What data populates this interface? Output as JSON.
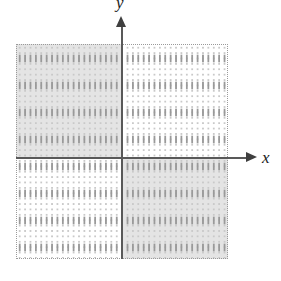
{
  "figure": {
    "kind": "coordinate-plane",
    "width": 281,
    "height": 281,
    "background_color": "#ffffff"
  },
  "axes": {
    "x": {
      "label": "x",
      "color": "#595959",
      "arrow_direction": "right",
      "arrow_color": "#3f3f3f"
    },
    "y": {
      "label": "y",
      "color": "#595959",
      "arrow_direction": "up",
      "arrow_color": "#3f3f3f"
    },
    "origin": {
      "x": 122,
      "y": 158
    }
  },
  "grid": {
    "left": 16,
    "top": 44,
    "right": 228,
    "bottom": 259,
    "minor_spacing": 5.4,
    "major_spacing": 27,
    "minor_dot_color": "#c9c9c9",
    "major_dot_color": "#9a9a9a",
    "border_color": "#9a9a9a"
  },
  "shaded_regions": [
    {
      "name": "quadrant-II",
      "label": "upper-left",
      "fill_color": "#e4e4e4",
      "left": 16,
      "top": 44,
      "width": 106,
      "height": 114
    },
    {
      "name": "quadrant-IV",
      "label": "lower-right",
      "fill_color": "#e4e4e4",
      "left": 122,
      "top": 158,
      "width": 106,
      "height": 101
    }
  ],
  "chart_data": {
    "type": "scatter",
    "title": "",
    "xlabel": "x",
    "ylabel": "y",
    "grid": true,
    "legend": "none",
    "xlim": [
      -4,
      4
    ],
    "ylim": [
      -3.75,
      4.25
    ],
    "annotations": [
      "Quadrant II shaded",
      "Quadrant IV shaded"
    ],
    "series": []
  }
}
